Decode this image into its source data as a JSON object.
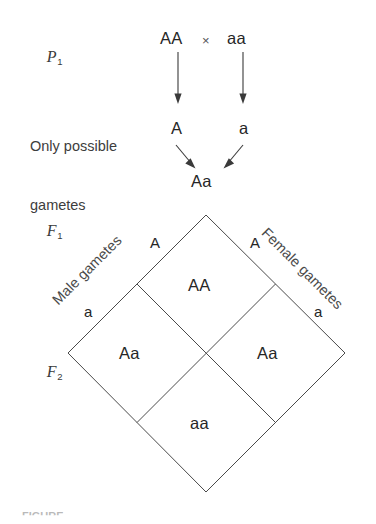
{
  "figure": {
    "background_color": "#ffffff",
    "line_color": "#4a4a4a",
    "text_color": "#2b2b2b"
  },
  "generations": {
    "p1": {
      "letter": "P",
      "subscript": "1"
    },
    "f1": {
      "letter": "F",
      "subscript": "1"
    },
    "f2": {
      "letter": "F",
      "subscript": "2"
    }
  },
  "parental_cross": {
    "parent_left": "AA",
    "cross_symbol": "×",
    "parent_right": "aa"
  },
  "gametes": {
    "label_line1": "Only possible",
    "label_line2": "gametes",
    "gamete_left": "A",
    "gamete_right": "a"
  },
  "f1_offspring": {
    "genotype": "Aa"
  },
  "punnett": {
    "male_axis_label": "Male gametes",
    "female_axis_label": "Female gametes",
    "male_alleles": [
      "A",
      "a"
    ],
    "female_alleles": [
      "A",
      "a"
    ],
    "edge_labels": {
      "top_left": "A",
      "top_right": "A",
      "bottom_left": "a",
      "bottom_right": "a"
    },
    "cells": {
      "top": "AA",
      "left": "Aa",
      "right": "Aa",
      "bottom": "aa"
    },
    "cell_list": [
      {
        "position": "top",
        "genotype": "AA"
      },
      {
        "position": "left",
        "genotype": "Aa"
      },
      {
        "position": "right",
        "genotype": "Aa"
      },
      {
        "position": "bottom",
        "genotype": "aa"
      }
    ]
  },
  "caption": {
    "text": "FIGURE"
  }
}
